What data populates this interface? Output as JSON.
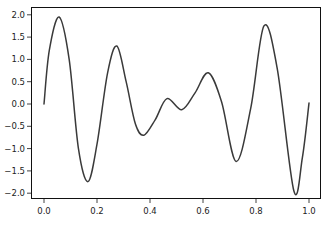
{
  "chart_data": {
    "type": "line",
    "title": "",
    "xlabel": "",
    "ylabel": "",
    "xlim": [
      -0.05,
      1.05
    ],
    "ylim": [
      -2.15,
      2.15
    ],
    "grid": false,
    "legend": null,
    "xticks": [
      0.0,
      0.2,
      0.4,
      0.6,
      0.8,
      1.0
    ],
    "xtick_labels": [
      "0.0",
      "0.2",
      "0.4",
      "0.6",
      "0.8",
      "1.0"
    ],
    "yticks": [
      2.0,
      1.5,
      1.0,
      0.5,
      0.0,
      -0.5,
      -1.0,
      -1.5,
      -2.0
    ],
    "ytick_labels": [
      "2.0",
      "1.5",
      "1.0",
      "0.5",
      "0.0",
      "−0.5",
      "−1.0",
      "−1.5",
      "−2.0"
    ],
    "series": [
      {
        "name": "signal",
        "color": "#3a3a3a",
        "x": [
          0.0,
          0.02,
          0.057,
          0.095,
          0.13,
          0.166,
          0.2,
          0.24,
          0.275,
          0.31,
          0.345,
          0.377,
          0.42,
          0.464,
          0.52,
          0.57,
          0.62,
          0.67,
          0.725,
          0.78,
          0.83,
          0.88,
          0.943,
          0.975,
          1.0
        ],
        "y": [
          0.0,
          1.2,
          1.95,
          1.0,
          -1.0,
          -1.74,
          -0.9,
          0.7,
          1.3,
          0.5,
          -0.45,
          -0.7,
          -0.35,
          0.12,
          -0.13,
          0.25,
          0.7,
          0.05,
          -1.29,
          -0.1,
          1.75,
          0.8,
          -1.95,
          -1.2,
          0.02
        ]
      }
    ]
  }
}
